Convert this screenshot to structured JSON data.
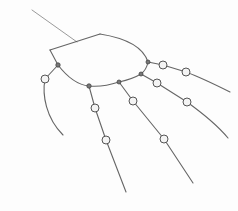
{
  "image": {
    "description": "Pencil sketch of a hand skeleton: an oval palm outline with five jointed finger lines extending outward",
    "palette": {
      "stroke": "#4a4a4a",
      "stroke_light": "#7a7a7a",
      "joint_fill": "#f4f4f4",
      "knuckle_fill": "#777777",
      "background": "#fdfdfd"
    },
    "parts": [
      "arm",
      "palm",
      "thumb",
      "finger-1",
      "finger-2",
      "finger-3",
      "finger-4"
    ]
  }
}
